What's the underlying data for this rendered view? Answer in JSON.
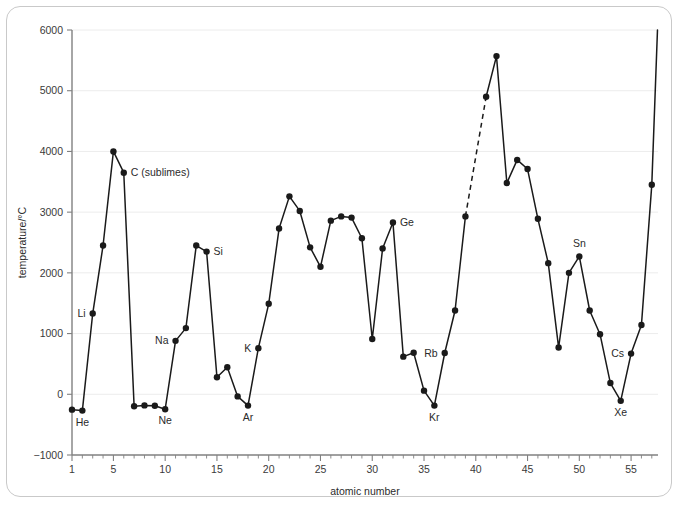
{
  "figure": {
    "border_color": "#c9c9c9",
    "background": "#ffffff"
  },
  "chart_data": {
    "type": "line",
    "title": "",
    "xlabel": "atomic number",
    "ylabel": "temperature/°C",
    "xlim": [
      1,
      57.6
    ],
    "ylim": [
      -1000,
      6000
    ],
    "grid": true,
    "legend": "none",
    "line_color": "#1a1a1a",
    "marker": "filled-circle",
    "x_ticks": [
      1,
      5,
      10,
      15,
      20,
      25,
      30,
      35,
      40,
      45,
      50,
      55
    ],
    "x_tick_labels": [
      "1",
      "5",
      "10",
      "15",
      "20",
      "25",
      "30",
      "35",
      "40",
      "45",
      "50",
      "55"
    ],
    "x_minor_tick_step": 1,
    "y_ticks": [
      -1000,
      0,
      1000,
      2000,
      3000,
      4000,
      5000,
      6000
    ],
    "y_tick_labels": [
      "−1000",
      "0",
      "1000",
      "2000",
      "3000",
      "4000",
      "5000",
      "6000"
    ],
    "x": [
      1,
      2,
      3,
      4,
      5,
      6,
      7,
      8,
      9,
      10,
      11,
      12,
      13,
      14,
      15,
      16,
      17,
      18,
      19,
      20,
      21,
      22,
      23,
      24,
      25,
      26,
      27,
      28,
      29,
      30,
      31,
      32,
      33,
      34,
      35,
      36,
      37,
      38,
      39,
      40,
      41,
      42,
      43,
      44,
      45,
      46,
      47,
      48,
      49,
      50,
      51,
      52,
      53,
      54,
      55,
      56,
      57
    ],
    "values": [
      -253,
      -269,
      1330,
      2450,
      4000,
      3650,
      -196,
      -183,
      -188,
      -246,
      880,
      1090,
      2450,
      2350,
      280,
      445,
      -35,
      -186,
      760,
      1490,
      2730,
      3260,
      3020,
      2420,
      2100,
      2860,
      2930,
      2910,
      2570,
      910,
      2400,
      2830,
      620,
      685,
      60,
      -186,
      680,
      1380,
      2930,
      null,
      4900,
      5570,
      3480,
      3860,
      3710,
      2890,
      2160,
      770,
      2000,
      2270,
      1380,
      990,
      185,
      -108,
      670,
      1140,
      3450
    ],
    "dashed_segment": {
      "from_x": 39,
      "to_x": 41,
      "note": "interpolated across element 40"
    },
    "point_labels": [
      {
        "x": 2,
        "text": "He",
        "position": "below"
      },
      {
        "x": 3,
        "text": "Li",
        "position": "left"
      },
      {
        "x": 6,
        "text": "C (sublimes)",
        "position": "right"
      },
      {
        "x": 10,
        "text": "Ne",
        "position": "below"
      },
      {
        "x": 11,
        "text": "Na",
        "position": "left"
      },
      {
        "x": 14,
        "text": "Si",
        "position": "right"
      },
      {
        "x": 18,
        "text": "Ar",
        "position": "below"
      },
      {
        "x": 19,
        "text": "K",
        "position": "left"
      },
      {
        "x": 32,
        "text": "Ge",
        "position": "right"
      },
      {
        "x": 36,
        "text": "Kr",
        "position": "below"
      },
      {
        "x": 37,
        "text": "Rb",
        "position": "left"
      },
      {
        "x": 50,
        "text": "Sn",
        "position": "above"
      },
      {
        "x": 54,
        "text": "Xe",
        "position": "below"
      },
      {
        "x": 55,
        "text": "Cs",
        "position": "left"
      }
    ]
  }
}
